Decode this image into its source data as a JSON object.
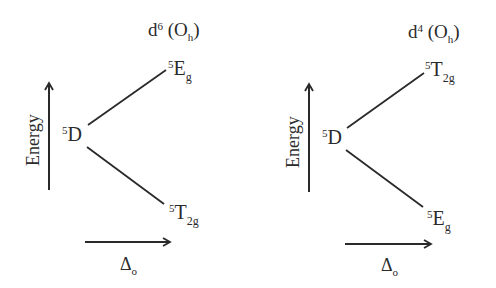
{
  "diagrams": [
    {
      "title": {
        "base": "d",
        "sup": "6",
        "paren_open": " (O",
        "sub": "h",
        "paren_close": ")"
      },
      "center_term": {
        "sup": "5",
        "base": "D"
      },
      "upper_term": {
        "sup": "5",
        "base": "E",
        "sub": "g"
      },
      "lower_term": {
        "sup": "5",
        "base": "T",
        "sub": "2g"
      },
      "y_axis_label": "Energy",
      "x_axis_label": {
        "base": "Δ",
        "sub": "o"
      }
    },
    {
      "title": {
        "base": "d",
        "sup": "4",
        "paren_open": " (O",
        "sub": "h",
        "paren_close": ")"
      },
      "center_term": {
        "sup": "5",
        "base": "D"
      },
      "upper_term": {
        "sup": "5",
        "base": "T",
        "sub": "2g"
      },
      "lower_term": {
        "sup": "5",
        "base": "E",
        "sub": "g"
      },
      "y_axis_label": "Energy",
      "x_axis_label": {
        "base": "Δ",
        "sub": "o"
      }
    }
  ],
  "colors": {
    "line": "#2a2a2a",
    "background": "#ffffff"
  }
}
